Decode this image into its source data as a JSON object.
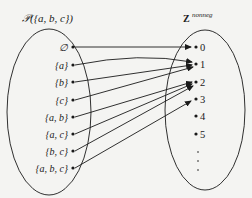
{
  "diagram": {
    "type": "function-mapping",
    "domain_set": {
      "title": "𝒫({a, b, c})",
      "elements": [
        "∅",
        "{a}",
        "{b}",
        "{c}",
        "{a, b}",
        "{a, c}",
        "{b, c}",
        "{a, b, c}"
      ]
    },
    "codomain_set": {
      "title_base": "Z",
      "title_superscript": "nonneg",
      "elements": [
        "0",
        "1",
        "2",
        "3",
        "4",
        "5"
      ],
      "continuation": "⋮"
    },
    "mappings": [
      {
        "from": "∅",
        "to": "0"
      },
      {
        "from": "{a}",
        "to": "1"
      },
      {
        "from": "{b}",
        "to": "1"
      },
      {
        "from": "{c}",
        "to": "1"
      },
      {
        "from": "{a, b}",
        "to": "2"
      },
      {
        "from": "{a, c}",
        "to": "2"
      },
      {
        "from": "{b, c}",
        "to": "2"
      },
      {
        "from": "{a, b, c}",
        "to": "3"
      }
    ],
    "colors": {
      "ink": "#1a1a1a",
      "background": "#f4f4f2"
    }
  }
}
